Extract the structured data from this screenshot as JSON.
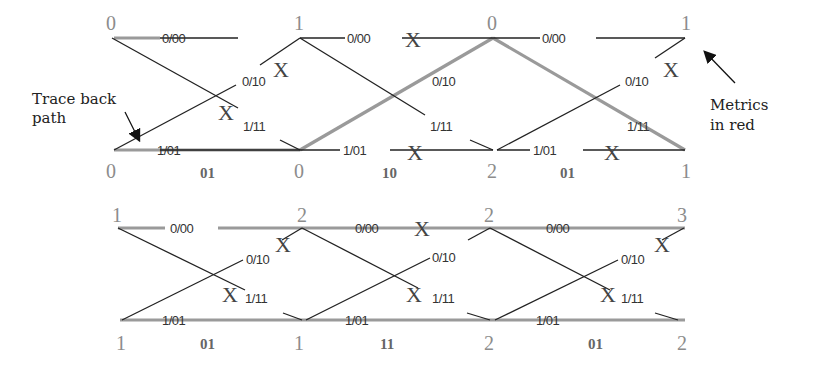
{
  "annotations": {
    "trace_back": [
      "Trace back",
      "path"
    ],
    "metrics": [
      "Metrics",
      "in red"
    ]
  },
  "branch_labels": {
    "s0_to_s0": "0/00",
    "s1_to_s0": "0/10",
    "s0_to_s1": "1/11",
    "s1_to_s1": "1/01"
  },
  "discard_marker": "X",
  "colors": {
    "edge": "#222222",
    "survivor_path": "#9a9a9a",
    "metric_text": "#8c8c8c"
  },
  "trellis_top": {
    "metrics_state0": [
      "0",
      "1",
      "0",
      "1"
    ],
    "metrics_state1": [
      "0",
      "0",
      "2",
      "1"
    ],
    "received": [
      "01",
      "10",
      "01"
    ]
  },
  "trellis_bottom": {
    "metrics_state0": [
      "1",
      "2",
      "2",
      "3"
    ],
    "metrics_state1": [
      "1",
      "1",
      "2",
      "2"
    ],
    "received": [
      "01",
      "11",
      "01"
    ]
  }
}
